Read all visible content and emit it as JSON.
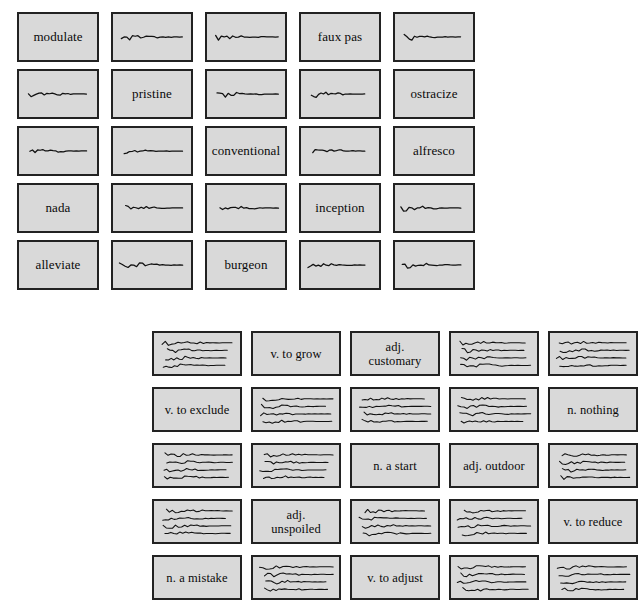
{
  "page": {
    "background_color": "#ffffff",
    "card_fill_color": "#d9d9d9",
    "card_border_color": "#222222",
    "ink_color": "#111111"
  },
  "word_grid": {
    "name": "word-card-grid",
    "columns": 5,
    "rows": 5,
    "cards": [
      {
        "type": "text",
        "label": "modulate"
      },
      {
        "type": "scribble",
        "label": "",
        "lines": 1
      },
      {
        "type": "scribble",
        "label": "",
        "lines": 1
      },
      {
        "type": "text",
        "label": "faux pas"
      },
      {
        "type": "scribble",
        "label": "",
        "lines": 1
      },
      {
        "type": "scribble",
        "label": "",
        "lines": 1
      },
      {
        "type": "text",
        "label": "pristine"
      },
      {
        "type": "scribble",
        "label": "",
        "lines": 1
      },
      {
        "type": "scribble",
        "label": "",
        "lines": 1
      },
      {
        "type": "text",
        "label": "ostracize"
      },
      {
        "type": "scribble",
        "label": "",
        "lines": 1
      },
      {
        "type": "scribble",
        "label": "",
        "lines": 1
      },
      {
        "type": "text",
        "label": "conventional"
      },
      {
        "type": "scribble",
        "label": "",
        "lines": 1
      },
      {
        "type": "text",
        "label": "alfresco"
      },
      {
        "type": "text",
        "label": "nada"
      },
      {
        "type": "scribble",
        "label": "",
        "lines": 1
      },
      {
        "type": "scribble",
        "label": "",
        "lines": 1
      },
      {
        "type": "text",
        "label": "inception"
      },
      {
        "type": "scribble",
        "label": "",
        "lines": 1
      },
      {
        "type": "text",
        "label": "alleviate"
      },
      {
        "type": "scribble",
        "label": "",
        "lines": 1
      },
      {
        "type": "text",
        "label": "burgeon"
      },
      {
        "type": "scribble",
        "label": "",
        "lines": 1
      },
      {
        "type": "scribble",
        "label": "",
        "lines": 1
      }
    ]
  },
  "definition_grid": {
    "name": "definition-card-grid",
    "columns": 5,
    "rows": 5,
    "cards": [
      {
        "type": "scribble",
        "label": "",
        "lines": 4
      },
      {
        "type": "text",
        "label": "v. to grow"
      },
      {
        "type": "text",
        "label": "adj.\ncustomary"
      },
      {
        "type": "scribble",
        "label": "",
        "lines": 4
      },
      {
        "type": "scribble",
        "label": "",
        "lines": 4
      },
      {
        "type": "text",
        "label": "v. to exclude"
      },
      {
        "type": "scribble",
        "label": "",
        "lines": 4
      },
      {
        "type": "scribble",
        "label": "",
        "lines": 4
      },
      {
        "type": "scribble",
        "label": "",
        "lines": 4
      },
      {
        "type": "text",
        "label": "n. nothing"
      },
      {
        "type": "scribble",
        "label": "",
        "lines": 4
      },
      {
        "type": "scribble",
        "label": "",
        "lines": 4
      },
      {
        "type": "text",
        "label": "n. a start"
      },
      {
        "type": "text",
        "label": "adj. outdoor"
      },
      {
        "type": "scribble",
        "label": "",
        "lines": 4
      },
      {
        "type": "scribble",
        "label": "",
        "lines": 4
      },
      {
        "type": "text",
        "label": "adj.\nunspoiled"
      },
      {
        "type": "scribble",
        "label": "",
        "lines": 4
      },
      {
        "type": "scribble",
        "label": "",
        "lines": 4
      },
      {
        "type": "text",
        "label": "v. to reduce"
      },
      {
        "type": "text",
        "label": "n. a mistake"
      },
      {
        "type": "scribble",
        "label": "",
        "lines": 4
      },
      {
        "type": "text",
        "label": "v. to adjust"
      },
      {
        "type": "scribble",
        "label": "",
        "lines": 4
      },
      {
        "type": "scribble",
        "label": "",
        "lines": 4
      }
    ]
  }
}
